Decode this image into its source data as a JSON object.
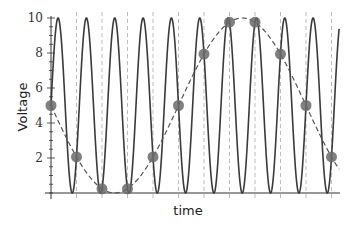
{
  "chart_data": {
    "type": "line",
    "title": "",
    "xlabel": "time",
    "ylabel": "Voltage",
    "ylim": [
      0,
      10
    ],
    "y_ticks": [
      2,
      4,
      6,
      8,
      10
    ],
    "y_minor_step": 0.5,
    "grid": false,
    "legend": null,
    "colors": {
      "signal": "#3a3a3a",
      "alias": "#555555",
      "sample_marker": "#6a6a6a",
      "sample_guides": "#bdbdbd",
      "axis": "#333333"
    },
    "series": [
      {
        "name": "original signal",
        "style": "solid",
        "formula": "5 + 5*sin(2*pi*0.9*n)",
        "frequency_cycles_per_sample": 0.9,
        "n_range": [
          0,
          11.3
        ]
      },
      {
        "name": "aliased reconstruction",
        "style": "dashed",
        "formula": "5 - 5*sin(2*pi*0.1*n)",
        "frequency_cycles_per_sample": 0.1,
        "n_range": [
          0,
          11.3
        ]
      },
      {
        "name": "samples",
        "style": "markers",
        "n": [
          0,
          1,
          2,
          3,
          4,
          5,
          6,
          7,
          8,
          9,
          10,
          11
        ],
        "values": [
          5.0,
          2.06,
          0.24,
          0.24,
          2.06,
          5.0,
          7.94,
          9.76,
          9.76,
          7.94,
          5.0,
          2.06
        ]
      }
    ]
  }
}
